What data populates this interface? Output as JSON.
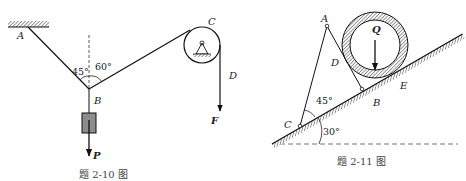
{
  "figures": [
    {
      "caption": "题 2-10 图",
      "labels": {
        "A": "A",
        "B": "B",
        "C": "C",
        "D": "D",
        "F": "F",
        "P": "P"
      },
      "angles": {
        "left": "45°",
        "right": "60°"
      }
    },
    {
      "caption": "题 2-11 图",
      "labels": {
        "A": "A",
        "B": "B",
        "C": "C",
        "D": "D",
        "E": "E",
        "Q": "Q"
      },
      "angles": {
        "apex_at_C": "45°",
        "incline": "30°"
      }
    }
  ]
}
